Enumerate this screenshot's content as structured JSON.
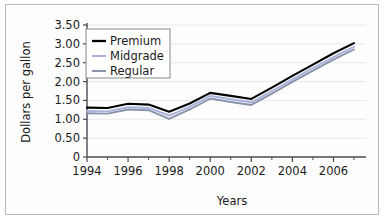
{
  "chart_data": {
    "type": "line",
    "title": "",
    "xlabel": "Years",
    "ylabel": "Dollars per gallon",
    "x": [
      1994,
      1995,
      1996,
      1997,
      1998,
      1999,
      2000,
      2001,
      2002,
      2003,
      2004,
      2005,
      2006,
      2007
    ],
    "xlim": [
      1994,
      2007
    ],
    "ylim": [
      0,
      3.5
    ],
    "xticks": [
      1994,
      1996,
      1998,
      2000,
      2002,
      2004,
      2006
    ],
    "xtick_labels": [
      "1994",
      "1996",
      "1998",
      "2000",
      "2002",
      "2004",
      "2006"
    ],
    "xminor_ticks": [
      1995,
      1997,
      1999,
      2001,
      2003,
      2005,
      2007
    ],
    "yticks": [
      0,
      0.5,
      1.0,
      1.5,
      2.0,
      2.5,
      3.0,
      3.5
    ],
    "ytick_labels": [
      "0",
      "0.50",
      "1.00",
      "1.50",
      "2.00",
      "2.50",
      "3.00",
      "3.50"
    ],
    "grid": true,
    "legend_position": "upper left",
    "series": [
      {
        "name": "Premium",
        "color": "#000000",
        "values": [
          1.31,
          1.3,
          1.41,
          1.39,
          1.2,
          1.42,
          1.7,
          1.62,
          1.54,
          1.84,
          2.15,
          2.45,
          2.75,
          3.02
        ]
      },
      {
        "name": "Midgrade",
        "color": "#a8b0dc",
        "values": [
          1.22,
          1.21,
          1.32,
          1.3,
          1.1,
          1.33,
          1.62,
          1.53,
          1.45,
          1.75,
          2.06,
          2.36,
          2.65,
          2.92
        ]
      },
      {
        "name": "Regular",
        "color": "#8a93a8",
        "values": [
          1.16,
          1.15,
          1.26,
          1.24,
          1.01,
          1.26,
          1.55,
          1.46,
          1.38,
          1.68,
          1.99,
          2.29,
          2.58,
          2.85
        ]
      }
    ]
  },
  "legend": {
    "items": [
      {
        "label": "Premium",
        "color": "#000000"
      },
      {
        "label": "Midgrade",
        "color": "#a8b0dc"
      },
      {
        "label": "Regular",
        "color": "#8a93a8"
      }
    ]
  },
  "axes": {
    "y_title": "Dollars per gallon",
    "x_title": "Years",
    "y_labels": [
      "3.50",
      "3.00",
      "2.50",
      "2.00",
      "1.50",
      "1.00",
      "0.50",
      "0"
    ],
    "x_labels": [
      "1994",
      "1996",
      "1998",
      "2000",
      "2002",
      "2004",
      "2006"
    ]
  },
  "colors": {
    "premium": "#000000",
    "midgrade": "#a8b0dc",
    "regular": "#8a93a8",
    "frame": "#b9b9b9",
    "grid": "#e8e8ea",
    "axis": "#4a4a52",
    "text": "#1a1a1a",
    "background": "#ffffff"
  }
}
